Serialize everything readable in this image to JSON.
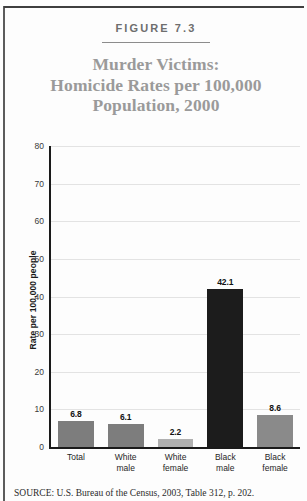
{
  "figure": {
    "number_label": "FIGURE 7.3",
    "title_lines": [
      "Murder Victims:",
      "Homicide Rates per 100,000",
      "Population, 2000"
    ],
    "source": "SOURCE: U.S. Bureau of the Census, 2003, Table 312, p. 202."
  },
  "colors": {
    "bar_gray": "#7d7d7d",
    "bar_light_gray": "#b0b0b0",
    "bar_black": "#1c1c1c",
    "title_gray": "#9a9a9a",
    "grid": "#e3e3e3",
    "axis": "#1a1a1a",
    "background": "#fdfdfd"
  },
  "chart_data": {
    "type": "bar",
    "title": "Murder Victims: Homicide Rates per 100,000 Population, 2000",
    "xlabel": "",
    "ylabel": "Rate per 100,000 people",
    "ylim": [
      0,
      80
    ],
    "yticks": [
      0,
      10,
      20,
      30,
      40,
      50,
      60,
      70,
      80
    ],
    "ytick_labels": [
      "0",
      "10",
      "20",
      "30",
      "40",
      "50",
      "60",
      "70",
      "80"
    ],
    "grid": true,
    "legend": "none",
    "categories": [
      "Total",
      "White male",
      "White female",
      "Black male",
      "Black female"
    ],
    "category_lines": [
      [
        "Total",
        ""
      ],
      [
        "White",
        "male"
      ],
      [
        "White",
        "female"
      ],
      [
        "Black",
        "male"
      ],
      [
        "Black",
        "female"
      ]
    ],
    "values": [
      6.8,
      6.1,
      2.2,
      42.1,
      8.6
    ],
    "value_labels": [
      "6.8",
      "6.1",
      "2.2",
      "42.1",
      "8.6"
    ],
    "bar_colors": [
      "#7d7d7d",
      "#7d7d7d",
      "#b0b0b0",
      "#1c1c1c",
      "#8a8a8a"
    ]
  }
}
